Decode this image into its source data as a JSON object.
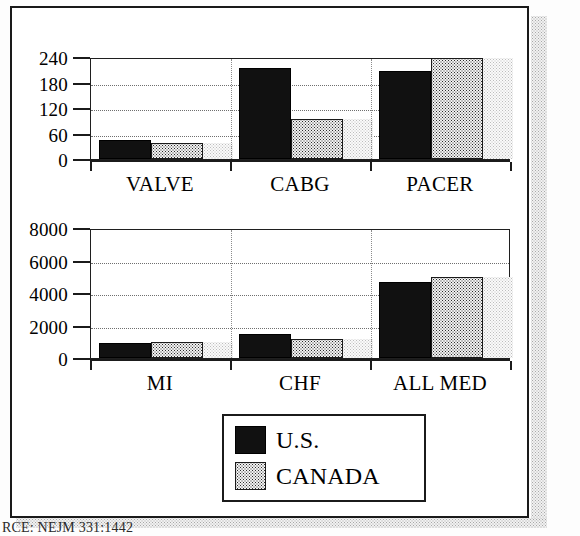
{
  "figure": {
    "caption": "RCE: NEJM 331:1442"
  },
  "legend": {
    "position": "bottom-center",
    "items": [
      {
        "label": "U.S.",
        "swatch": "solid-black-swatch",
        "color": "#111111"
      },
      {
        "label": "CANADA",
        "swatch": "stippled-swatch",
        "color": "#f2f2f2"
      }
    ]
  },
  "chart_data": [
    {
      "id": "procedures",
      "type": "bar",
      "title": "",
      "xlabel": "",
      "ylabel": "",
      "categories": [
        "VALVE",
        "CABG",
        "PACER"
      ],
      "series": [
        {
          "name": "U.S.",
          "values": [
            45,
            215,
            208
          ]
        },
        {
          "name": "CANADA",
          "values": [
            38,
            93,
            238
          ]
        }
      ],
      "ylim": [
        0,
        240
      ],
      "yticks": [
        0,
        60,
        120,
        180,
        240
      ],
      "ytick_labels": [
        "0",
        "60",
        "120",
        "180",
        "240"
      ],
      "grid": true,
      "legend": "shared"
    },
    {
      "id": "medical-conditions",
      "type": "bar",
      "title": "",
      "xlabel": "",
      "ylabel": "",
      "categories": [
        "MI",
        "CHF",
        "ALL MED"
      ],
      "series": [
        {
          "name": "U.S.",
          "values": [
            900,
            1500,
            4700
          ]
        },
        {
          "name": "CANADA",
          "values": [
            1000,
            1200,
            5000
          ]
        }
      ],
      "ylim": [
        0,
        8000
      ],
      "yticks": [
        0,
        2000,
        4000,
        6000,
        8000
      ],
      "ytick_labels": [
        "0",
        "2000",
        "4000",
        "6000",
        "8000"
      ],
      "grid": true,
      "legend": "shared"
    }
  ]
}
